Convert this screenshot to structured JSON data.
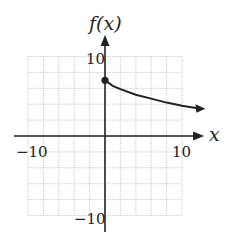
{
  "chart_data": {
    "type": "line",
    "title": "",
    "xlabel": "x",
    "ylabel": "f(x)",
    "xlim": [
      -10,
      10
    ],
    "ylim": [
      -10,
      10
    ],
    "grid": true,
    "grid_step": 2,
    "x_tick_labels": [
      "-10",
      "10"
    ],
    "y_tick_labels": [
      "10",
      "-10"
    ],
    "series": [
      {
        "name": "f(x)",
        "start_point": {
          "x": 0,
          "y": 7,
          "closed": true
        },
        "x": [
          0,
          1,
          2,
          4,
          6,
          8,
          10,
          12
        ],
        "y": [
          7,
          6.3,
          5.9,
          5.2,
          4.7,
          4.2,
          3.8,
          3.5
        ],
        "end_arrow": true
      }
    ]
  },
  "labels": {
    "y_axis": "f(x)",
    "x_axis": "x",
    "x_min": "−10",
    "x_max": "10",
    "y_max": "10",
    "y_min": "−10"
  }
}
